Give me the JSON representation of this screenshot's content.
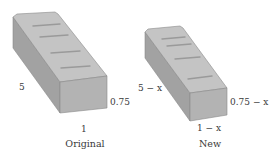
{
  "figures": [
    {
      "caption": "Original",
      "labels": {
        "length": "5",
        "height": "0.75",
        "width": "1"
      }
    },
    {
      "caption": "New",
      "labels": {
        "length": "5 − x",
        "height": "0.75 − x",
        "width": "1 − x"
      }
    }
  ],
  "colors": {
    "top_face": "#c4c4c4",
    "front_face": "#b3b3b3",
    "side_face": "#a2a2a2",
    "edge": "#8a8a8a",
    "groove": "#9a9a9a",
    "text": "#3a3a3a"
  }
}
